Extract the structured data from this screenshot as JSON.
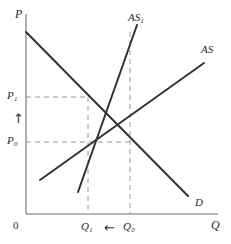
{
  "figure": {
    "type": "economics-diagram",
    "width": 231,
    "height": 244,
    "background_color": "#ffffff",
    "line_color": "#333333",
    "dash_color": "#9a9a9a"
  },
  "axes": {
    "y_axis_label": "P",
    "x_axis_label": "Q",
    "origin_label": "0",
    "x_ticks": [
      {
        "label": "Q",
        "sub": "1",
        "x": 88
      },
      {
        "label": "Q",
        "sub": "0",
        "x": 130
      }
    ],
    "y_ticks": [
      {
        "label": "P",
        "sub": "1",
        "y": 97
      },
      {
        "label": "P",
        "sub": "0",
        "y": 142
      }
    ]
  },
  "curves": [
    {
      "name": "demand",
      "label": "D",
      "label_sub": "",
      "x1": 26,
      "y1": 32,
      "x2": 188,
      "y2": 196,
      "label_x": 195,
      "label_y": 197
    },
    {
      "name": "aggregate-supply",
      "label": "AS",
      "label_sub": "",
      "x1": 40,
      "y1": 180,
      "x2": 204,
      "y2": 63,
      "label_x": 201,
      "label_y": 44
    },
    {
      "name": "aggregate-supply-shifted",
      "label": "AS",
      "label_sub": "1",
      "x1": 78,
      "y1": 192,
      "x2": 137,
      "y2": 25,
      "label_x": 128,
      "label_y": 12
    }
  ],
  "equilibria": [
    {
      "name": "initial-equilibrium",
      "price_label": "P",
      "price_sub": "0",
      "quantity_label": "Q",
      "quantity_sub": "0",
      "x": 130,
      "y": 142
    },
    {
      "name": "new-equilibrium",
      "price_label": "P",
      "price_sub": "1",
      "quantity_label": "Q",
      "quantity_sub": "1",
      "x": 88,
      "y": 97
    }
  ],
  "annotations": {
    "price_arrow": "↑",
    "price_arrow_meaning": "price rises",
    "quantity_arrow": "←",
    "quantity_arrow_meaning": "quantity falls"
  },
  "chart_data": {
    "type": "line",
    "title": "",
    "xlabel": "Q",
    "ylabel": "P",
    "grid": false,
    "legend": "inline-curve-labels",
    "series": [
      {
        "name": "D",
        "points": [
          [
            26,
            32
          ],
          [
            188,
            196
          ]
        ]
      },
      {
        "name": "AS",
        "points": [
          [
            40,
            180
          ],
          [
            204,
            63
          ]
        ]
      },
      {
        "name": "AS1",
        "points": [
          [
            78,
            192
          ],
          [
            137,
            25
          ]
        ]
      }
    ],
    "markers": [
      {
        "name": "P0Q0",
        "x": 130,
        "y": 142
      },
      {
        "name": "P1Q1",
        "x": 88,
        "y": 97
      }
    ]
  }
}
